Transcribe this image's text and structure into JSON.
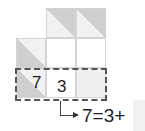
{
  "diagram": {
    "type": "kakuro-clue-explanation",
    "grid": {
      "cell_size": 30,
      "cells": [
        {
          "row": 0,
          "col": 1,
          "kind": "clue",
          "value": ""
        },
        {
          "row": 0,
          "col": 2,
          "kind": "clue",
          "value": ""
        },
        {
          "row": 1,
          "col": 0,
          "kind": "clue",
          "value": ""
        },
        {
          "row": 1,
          "col": 1,
          "kind": "empty",
          "value": ""
        },
        {
          "row": 1,
          "col": 2,
          "kind": "empty",
          "value": ""
        },
        {
          "row": 2,
          "col": 0,
          "kind": "clue",
          "value": "7"
        },
        {
          "row": 2,
          "col": 1,
          "kind": "digit",
          "value": "3"
        },
        {
          "row": 2,
          "col": 2,
          "kind": "empty-shaded",
          "value": ""
        }
      ]
    },
    "clue_value": "7",
    "digit_value": "3",
    "highlight": "dashed box around bottom row",
    "equation": "7=3+",
    "colors": {
      "clue_dark": "#cfcfcf",
      "clue_light": "#f2f2f2",
      "grid_line": "#d4d4d4",
      "dash": "#555555",
      "answer_box": "#f2f2f2"
    }
  }
}
